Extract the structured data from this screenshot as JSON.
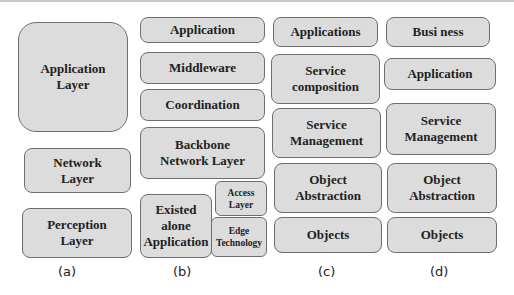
{
  "diagram": {
    "panels": [
      {
        "caption": "(a)",
        "boxes": [
          {
            "label": "Application\nLayer"
          },
          {
            "label": "Network\nLayer"
          },
          {
            "label": "Perception\nLayer"
          }
        ]
      },
      {
        "caption": "(b)",
        "boxes": [
          {
            "label": "Application"
          },
          {
            "label": "Middleware"
          },
          {
            "label": "Coordination"
          },
          {
            "label": "Backbone\nNetwork Layer"
          },
          {
            "label": "Existed\nalone\nApplication"
          },
          {
            "label": "Access\nLayer"
          },
          {
            "label": "Edge\nTechnology"
          }
        ]
      },
      {
        "caption": "(c)",
        "boxes": [
          {
            "label": "Applications"
          },
          {
            "label": "Service\ncomposition"
          },
          {
            "label": "Service\nManagement"
          },
          {
            "label": "Object\nAbstraction"
          },
          {
            "label": "Objects"
          }
        ]
      },
      {
        "caption": "(d)",
        "boxes": [
          {
            "label": "Busi ness"
          },
          {
            "label": "Application"
          },
          {
            "label": "Service\nManagement"
          },
          {
            "label": "Object\nAbstraction"
          },
          {
            "label": "Objects"
          }
        ]
      }
    ],
    "colors": {
      "box_fill": "#dcdcdc",
      "box_border": "#6e6e6e",
      "text": "#222222"
    }
  }
}
